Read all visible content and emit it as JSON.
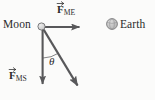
{
  "figure": {
    "type": "free-body-force-diagram",
    "background_color": "#fbfbfa",
    "stroke_color": "#58585a",
    "text_color": "#2b2b2b",
    "width": 155,
    "height": 100
  },
  "bodies": [
    {
      "id": "moon",
      "label": "Moon",
      "label_x": 3,
      "label_y": 19,
      "cx": 41.5,
      "cy": 26.5,
      "r": 3.6,
      "fill": "#d8d8d8",
      "stroke": "#6e6e70"
    },
    {
      "id": "earth",
      "label": "Earth",
      "label_x": 120,
      "label_y": 19,
      "cx": 112,
      "cy": 24,
      "r": 5.4,
      "fill": "#c9c9c9",
      "stroke": "#7a7a7c"
    }
  ],
  "vectors": [
    {
      "id": "F_ME",
      "symbol": "F",
      "subscript": "ME",
      "description": "force on Moon from Earth",
      "direction": "right",
      "from_x": 45,
      "from_y": 27,
      "to_x": 81,
      "to_y": 27,
      "label_x": 57,
      "label_y": 4,
      "has_vector_arrow": true
    },
    {
      "id": "F_MS",
      "symbol": "F",
      "subscript": "MS",
      "description": "force on Moon from Sun",
      "direction": "down",
      "from_x": 42.5,
      "from_y": 30,
      "to_x": 42.5,
      "to_y": 86,
      "label_x": 9,
      "label_y": 70,
      "has_vector_arrow": true
    },
    {
      "id": "F_resultant",
      "symbol": "",
      "subscript": "",
      "description": "resultant force vector (unlabeled diagonal)",
      "direction": "down-right",
      "from_x": 44,
      "from_y": 30,
      "to_x": 80,
      "to_y": 89,
      "label_x": null,
      "label_y": null,
      "has_vector_arrow": false
    }
  ],
  "angle": {
    "id": "theta",
    "symbol": "θ",
    "label_x": 49,
    "label_y": 56,
    "between": [
      "F_MS",
      "F_resultant"
    ],
    "arc_radius": 28,
    "vertex_x": 43,
    "vertex_y": 29
  }
}
